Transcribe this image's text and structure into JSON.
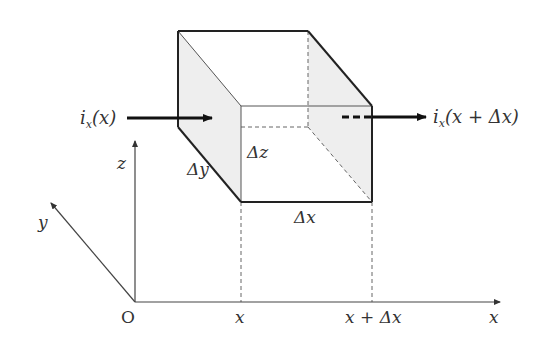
{
  "diagram": {
    "type": "3D control volume (cuboid) with current flux",
    "labels": {
      "inflow": "i",
      "inflow_sub": "x",
      "inflow_arg": "(x)",
      "outflow": "i",
      "outflow_sub": "x",
      "outflow_arg": "(x + Δx)",
      "dx": "Δx",
      "dy": "Δy",
      "dz": "Δz",
      "axis_x": "x",
      "axis_y": "y",
      "axis_z": "z",
      "origin": "O",
      "tick_x": "x",
      "tick_x_plus_dx": "x + Δx"
    },
    "colors": {
      "line": "#222222",
      "thin_line": "#555555",
      "face_fill": "#eeeeee",
      "text": "#333333"
    }
  }
}
